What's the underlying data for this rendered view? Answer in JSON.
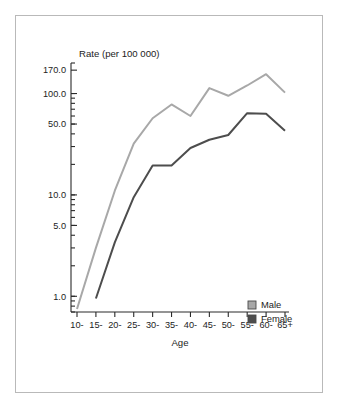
{
  "figure": {
    "frame_border_color": "#b9b9b9",
    "background": "#ffffff"
  },
  "chart_data": {
    "type": "line",
    "title": "",
    "y_caption": "Rate (per 100 000)",
    "xlabel": "Age",
    "ylabel": "Rate (per 100 000)",
    "yscale": "log",
    "ylim": [
      0.7,
      200.0
    ],
    "grid": false,
    "legend_position": "lower-right",
    "categories": [
      "10-",
      "15-",
      "20-",
      "25-",
      "30-",
      "35-",
      "40-",
      "45-",
      "50-",
      "55-",
      "60-",
      "65+"
    ],
    "ytick_labels": [
      "170.0",
      "100.0",
      "50.0",
      "10.0",
      "5.0",
      "1.0"
    ],
    "ytick_values": [
      170.0,
      100.0,
      50.0,
      10.0,
      5.0,
      1.0
    ],
    "series": [
      {
        "name": "Male",
        "color": "#a8a8a8",
        "values": [
          0.75,
          3.0,
          11.0,
          32.0,
          57.0,
          78.0,
          60.0,
          113.0,
          95.0,
          120.0,
          155.0,
          102.0
        ]
      },
      {
        "name": "Female",
        "color": "#4d4d4d",
        "values": [
          null,
          0.95,
          3.4,
          9.5,
          19.5,
          19.5,
          29.0,
          35.0,
          39.0,
          64.0,
          63.0,
          43.0
        ]
      }
    ],
    "legend": [
      {
        "label": "Male",
        "color": "#a8a8a8"
      },
      {
        "label": "Female",
        "color": "#4d4d4d"
      }
    ]
  }
}
